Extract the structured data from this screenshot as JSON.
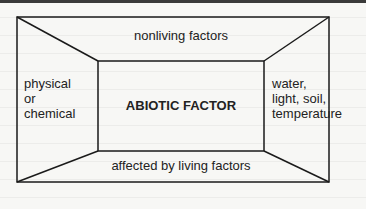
{
  "diagram": {
    "title": "ABIOTIC FACTOR",
    "top": "nonliving factors",
    "bottom": "affected by living factors",
    "left": [
      "physical",
      "or",
      "chemical"
    ],
    "right": [
      "water,",
      "light, soil,",
      "temperature"
    ]
  },
  "colors": {
    "line": "#1a1a1a",
    "background": "#f7f7f5",
    "topbar": "#3a3a3a"
  }
}
